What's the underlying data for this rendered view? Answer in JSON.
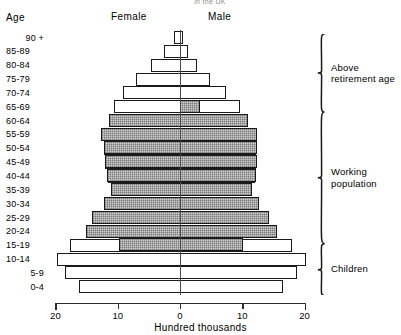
{
  "top_title": "in the UK",
  "headers": {
    "age": "Age",
    "female": "Female",
    "male": "Male"
  },
  "axis": {
    "xlabel": "Hundred thousands",
    "ticks": [
      "20",
      "10",
      "0",
      "10",
      "20"
    ]
  },
  "brackets": [
    {
      "label": "Above\nretirement age"
    },
    {
      "label": "Working\npopulation"
    },
    {
      "label": "Children"
    }
  ],
  "chart_data": {
    "type": "bar",
    "subtype": "population-pyramid",
    "title": "in the UK",
    "xlabel": "Hundred thousands",
    "ylabel": "Age",
    "xlim": [
      -20,
      20
    ],
    "xticks": [
      20,
      10,
      0,
      10,
      20
    ],
    "grid": false,
    "legend": [
      "Female",
      "Male"
    ],
    "units": "hundred thousands",
    "categories": [
      "90 +",
      "85-89",
      "80-84",
      "75-79",
      "70-74",
      "65-69",
      "60-64",
      "55-59",
      "50-54",
      "45-49",
      "40-44",
      "35-39",
      "30-34",
      "25-29",
      "20-24",
      "15-19",
      "10-14",
      "5-9",
      "0-4"
    ],
    "series": [
      {
        "name": "Female",
        "values": [
          1.0,
          2.6,
          4.6,
          7.0,
          9.2,
          10.6,
          11.4,
          12.6,
          12.2,
          12.0,
          11.6,
          11.0,
          12.2,
          14.0,
          15.0,
          17.6,
          19.8,
          18.4,
          16.2
        ]
      },
      {
        "name": "Male",
        "values": [
          0.5,
          1.3,
          2.8,
          4.8,
          7.4,
          9.6,
          10.8,
          12.2,
          12.2,
          12.2,
          12.0,
          11.4,
          12.6,
          14.2,
          15.4,
          18.0,
          20.2,
          18.8,
          16.6
        ]
      }
    ],
    "annotations": [
      {
        "text": "Above retirement age",
        "bands": [
          "90 +",
          "85-89",
          "80-84",
          "75-79",
          "70-74",
          "65-69"
        ]
      },
      {
        "text": "Working population",
        "bands": [
          "65-69",
          "60-64",
          "55-59",
          "50-54",
          "45-49",
          "40-44",
          "35-39",
          "30-34",
          "25-29",
          "20-24",
          "15-19"
        ]
      },
      {
        "text": "Children",
        "bands": [
          "15-19",
          "10-14",
          "5-9",
          "0-4"
        ]
      }
    ]
  }
}
